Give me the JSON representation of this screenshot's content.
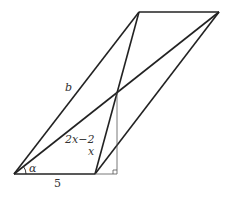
{
  "diagram": {
    "type": "geometry",
    "colors": {
      "stroke": "#222222",
      "thin_stroke": "#555555",
      "text": "#333333",
      "background": "#ffffff"
    },
    "points": {
      "A": [
        14,
        174
      ],
      "B": [
        95,
        174
      ],
      "H": [
        117,
        174
      ],
      "P": [
        117,
        93
      ],
      "T1": [
        139,
        12
      ],
      "T2": [
        219,
        12
      ]
    },
    "segments": [
      {
        "name": "side-b",
        "from": "A",
        "to": "T1",
        "weight": "thick"
      },
      {
        "name": "diagonal-long",
        "from": "A",
        "to": "T2",
        "weight": "thick"
      },
      {
        "name": "diagonal-short",
        "from": "B",
        "to": "T1",
        "weight": "thick"
      },
      {
        "name": "side-right",
        "from": "B",
        "to": "T2",
        "weight": "thick"
      },
      {
        "name": "side-top",
        "from": "T1",
        "to": "T2",
        "weight": "thick"
      },
      {
        "name": "base-5",
        "from": "A",
        "to": "B",
        "weight": "thick"
      },
      {
        "name": "base-extension",
        "from": "B",
        "to": "H",
        "weight": "thin"
      },
      {
        "name": "height",
        "from": "H",
        "to": "P",
        "weight": "thin"
      }
    ],
    "labels": {
      "b": "b",
      "diag_part": "2x−2",
      "x": "x",
      "alpha": "α",
      "base": "5"
    },
    "right_angle_marker": "H"
  }
}
